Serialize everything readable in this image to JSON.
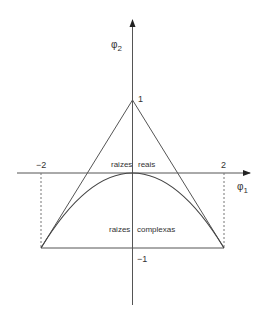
{
  "diagram": {
    "type": "stability-triangle",
    "axes": {
      "x_label": "φ",
      "x_label_sub": "1",
      "y_label": "φ",
      "y_label_sub": "2"
    },
    "ticks": {
      "x_neg": "−2",
      "x_pos": "2",
      "y_pos": "1",
      "y_neg": "−1"
    },
    "regions": {
      "real_left": "raizes",
      "real_right": "reais",
      "complex_left": "raizes",
      "complex_right": "complexas"
    },
    "triangle_vertices": [
      [
        -2,
        -1
      ],
      [
        0,
        1
      ],
      [
        2,
        -1
      ]
    ],
    "parabola": "φ2 = −φ1²/4",
    "colors": {
      "line": "#555555",
      "text": "#333333"
    }
  }
}
